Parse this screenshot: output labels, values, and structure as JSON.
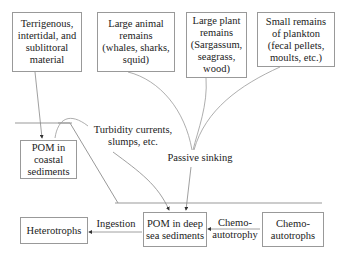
{
  "diagram": {
    "sources": [
      {
        "id": "terrigenous",
        "text": "Terrigenous,\nintertidal, and\nsublittoral\nmaterial"
      },
      {
        "id": "large-animal",
        "text": "Large animal\nremains\n(whales, sharks,\nsquid)"
      },
      {
        "id": "large-plant",
        "text": "Large plant\nremains\n(Sargassum,\nseagrass,\nwood)"
      },
      {
        "id": "small-plankton",
        "text": "Small remains\nof plankton\n(fecal pellets,\nmoults, etc.)"
      }
    ],
    "pom_coastal": "POM in\ncoastal\nsediments",
    "pom_deep": "POM in deep\nsea sediments",
    "heterotrophs": "Heterotrophs",
    "chemoautotrophs": "Chemo-\nautotrophs",
    "labels": {
      "turbidity": "Turbidity currents,\nslumps, etc.",
      "passive_sinking": "Passive sinking",
      "ingestion": "Ingestion",
      "chemoautotrophy": "Chemo-\nautotrophy"
    },
    "colors": {
      "line": "#999999",
      "box_border": "#999999",
      "text": "#222222"
    }
  }
}
